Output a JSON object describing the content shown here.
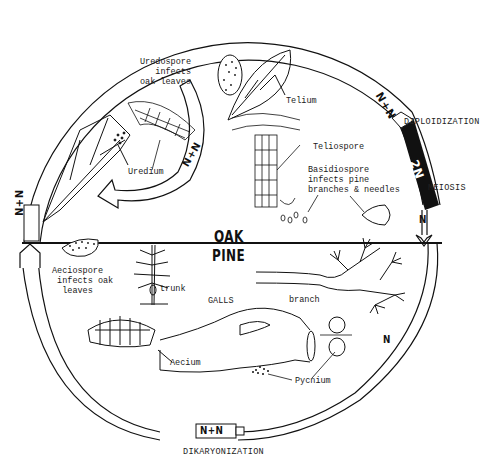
{
  "hosts": {
    "upper": "OAK",
    "lower": "PINE"
  },
  "stages": {
    "diploidization": "DIPLOIDIZATION",
    "meiosis": "MEIOSIS",
    "dikaryonization": "DIKARYONIZATION"
  },
  "ploidy": {
    "right_top": "N+N",
    "right_diploid": "2N",
    "right_after_meiosis": "N",
    "right_lower": "N",
    "bottom": "N+N",
    "left": "N+N",
    "inner_oak_arrow": "N+N"
  },
  "labels": {
    "uredospore": "Uredospore\ninfects\noak leaves",
    "uredium": "Uredium",
    "telium": "Telium",
    "teliospore": "Teliospore",
    "basidiospore": "Basidiospore\ninfects pine\nbranches & needles",
    "aeciospore": "Aeciospore\n infects oak\n  leaves",
    "trunk": "trunk",
    "galls": "GALLS",
    "branch": "branch",
    "aecium": "Aecium",
    "pycnium": "Pycnium"
  },
  "colors": {
    "line": "#111111",
    "background": "#ffffff",
    "diploid_band": "#111111"
  }
}
